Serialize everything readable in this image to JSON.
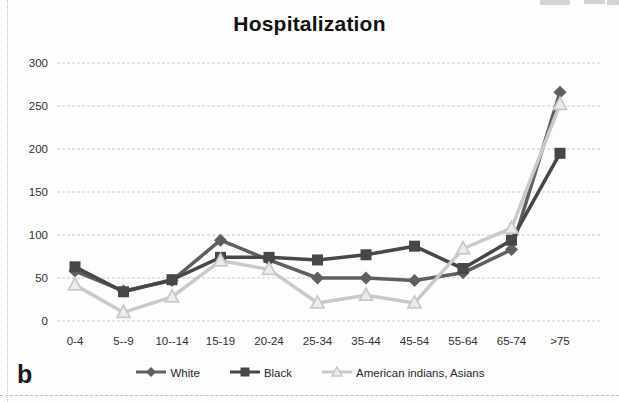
{
  "panel_label": "b",
  "chart_data": {
    "type": "line",
    "title": "Hospitalization",
    "categories": [
      "0-4",
      "5--9",
      "10--14",
      "15-19",
      "20-24",
      "25-34",
      "35-44",
      "45-54",
      "55-64",
      "65-74",
      ">75"
    ],
    "series": [
      {
        "name": "White",
        "marker": "diamond",
        "color": "#5f5f5f",
        "values": [
          58,
          35,
          47,
          94,
          71,
          50,
          50,
          47,
          56,
          83,
          266
        ]
      },
      {
        "name": "Black",
        "marker": "square",
        "color": "#474747",
        "values": [
          63,
          34,
          48,
          74,
          74,
          71,
          77,
          87,
          61,
          94,
          195
        ]
      },
      {
        "name": "American indians, Asians",
        "marker": "triangle",
        "color": "#c9c9c9",
        "marker_fill": "#ececec",
        "values": [
          42,
          10,
          28,
          70,
          60,
          21,
          30,
          21,
          84,
          108,
          252
        ]
      }
    ],
    "xlabel": "",
    "ylabel": "",
    "ylim": [
      0,
      300
    ],
    "yticks": [
      0,
      50,
      100,
      150,
      200,
      250,
      300
    ],
    "grid": "horizontal-dashed",
    "gridline_color": "#c9c9c9",
    "legend_position": "bottom"
  }
}
